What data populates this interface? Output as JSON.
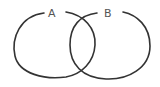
{
  "diagram": {
    "type": "venn",
    "sets": [
      {
        "label": "A",
        "color": "#333333"
      },
      {
        "label": "B",
        "color": "#333333"
      }
    ],
    "label_color": "#555555",
    "background": "#ffffff"
  }
}
